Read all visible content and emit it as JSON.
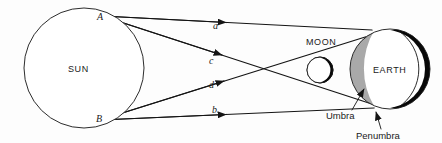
{
  "figure": {
    "background_color": "#fdfdfd",
    "line_color": "#141414",
    "shadow_gray": "#a9a9a9",
    "night_black": "#080808"
  },
  "bodies": {
    "sun": {
      "label": "SUN",
      "cx": 84,
      "cy": 68,
      "r": 60
    },
    "moon": {
      "label": "MOON",
      "cx": 320,
      "cy": 70,
      "r": 13
    },
    "earth": {
      "label": "EARTH",
      "cx": 390,
      "cy": 69,
      "r": 40
    }
  },
  "vertices": [
    {
      "id": "A",
      "label": "A",
      "x": 102,
      "y": 16,
      "note": "upper tangent point on Sun"
    },
    {
      "id": "B",
      "label": "B",
      "x": 100,
      "y": 120,
      "note": "lower tangent point on Sun"
    }
  ],
  "rays": [
    {
      "id": "a",
      "label": "a",
      "from": "A",
      "arrow_at": {
        "x": 228,
        "y": 42
      }
    },
    {
      "id": "c",
      "label": "c",
      "from": "A",
      "arrow_at": {
        "x": 222,
        "y": 63
      }
    },
    {
      "id": "d",
      "label": "d",
      "from": "B",
      "arrow_at": {
        "x": 224,
        "y": 80
      }
    },
    {
      "id": "b",
      "label": "b",
      "from": "B",
      "arrow_at": {
        "x": 228,
        "y": 99
      }
    }
  ],
  "ray_labels": [
    {
      "text": "a",
      "x": 213,
      "y": 29
    },
    {
      "text": "c",
      "x": 209,
      "y": 64
    },
    {
      "text": "d",
      "x": 209,
      "y": 86
    },
    {
      "text": "b",
      "x": 212,
      "y": 113
    }
  ],
  "shadow_labels": [
    {
      "id": "umbra",
      "text": "Umbra",
      "text_x": 330,
      "text_y": 117,
      "leader": {
        "x1": 352,
        "y1": 110,
        "x2": 366,
        "y2": 86
      }
    },
    {
      "id": "penumbra",
      "text": "Penumbra",
      "text_x": 360,
      "text_y": 138,
      "leader": {
        "x1": 381,
        "y1": 130,
        "x2": 375,
        "y2": 110
      }
    }
  ],
  "body_labels": [
    {
      "id": "sun-label",
      "text": "SUN",
      "x": 68,
      "y": 72
    },
    {
      "id": "moon-label",
      "text": "MOON",
      "x": 306,
      "y": 45
    },
    {
      "id": "earth-label",
      "text": "EARTH",
      "x": 375,
      "y": 73
    }
  ]
}
